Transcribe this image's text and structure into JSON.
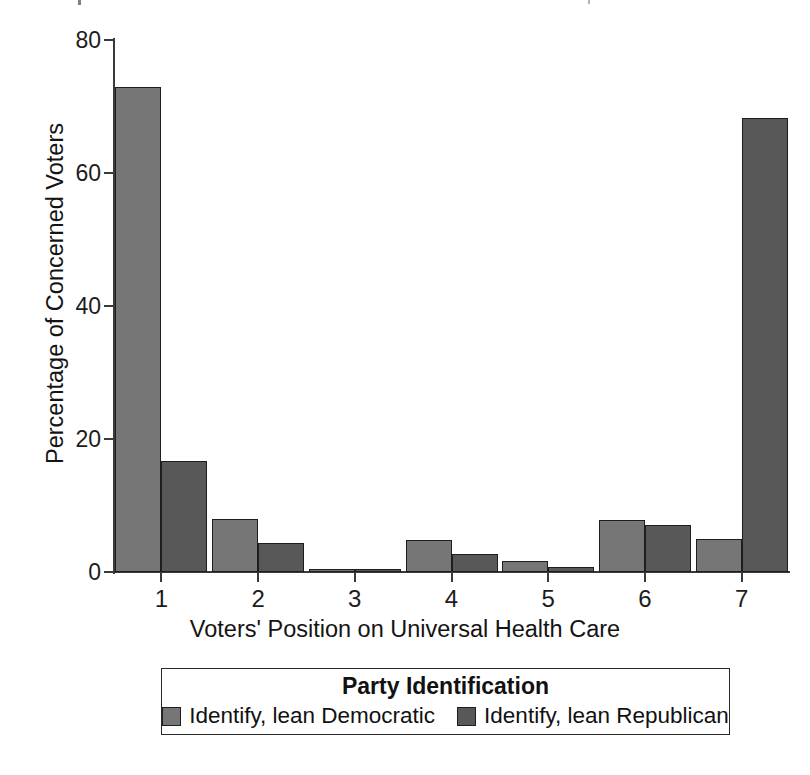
{
  "chart_data": {
    "type": "bar",
    "title": "",
    "xlabel": "Voters' Position on Universal Health Care",
    "ylabel": "Percentage of Concerned Voters",
    "categories": [
      "1",
      "2",
      "3",
      "4",
      "5",
      "6",
      "7"
    ],
    "ylim": [
      0,
      80
    ],
    "yticks": [
      0,
      20,
      40,
      60,
      80
    ],
    "ytick_labels": [
      "0",
      "20",
      "40",
      "60",
      "80"
    ],
    "grid": false,
    "legend_position": "below-axes",
    "legend_title": "Party Identification",
    "series": [
      {
        "name": "Identify, lean Democratic",
        "color": "#767676",
        "values": [
          73.0,
          7.9,
          0.5,
          4.8,
          1.6,
          7.8,
          4.9
        ]
      },
      {
        "name": "Identify, lean Republican",
        "color": "#585858",
        "values": [
          16.7,
          4.4,
          0.3,
          2.7,
          0.8,
          7.0,
          68.3
        ]
      }
    ]
  },
  "axis": {
    "y_title": "Percentage of Concerned Voters",
    "x_title": "Voters' Position on Universal Health Care"
  },
  "legend": {
    "title": "Party Identification",
    "items": [
      {
        "label": "Identify, lean Democratic",
        "color": "#767676"
      },
      {
        "label": "Identify, lean Republican",
        "color": "#585858"
      }
    ]
  }
}
